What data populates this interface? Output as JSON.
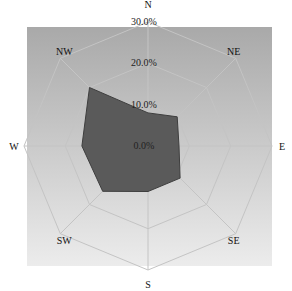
{
  "chart_data": {
    "type": "radar",
    "title": "",
    "categories": [
      "N",
      "NE",
      "E",
      "SE",
      "S",
      "SW",
      "W",
      "NW"
    ],
    "series": [
      {
        "name": "frequency",
        "values": [
          8.0,
          10.0,
          7.5,
          11.0,
          11.0,
          15.5,
          16.0,
          20.0
        ]
      }
    ],
    "radial_ticks": [
      "0.0%",
      "10.0%",
      "20.0%",
      "30.0%"
    ],
    "radial_tick_values": [
      0,
      10,
      20,
      30
    ],
    "rlim": [
      0,
      30
    ],
    "grid": true,
    "grid_shape": "octagon",
    "legend": "none"
  },
  "colors": {
    "plot_bg_top": "#a9a9a9",
    "plot_bg_bottom": "#ececec",
    "fill": "#5a5a5a",
    "stroke": "#3e3e3e",
    "grid": "#c4c4c4"
  }
}
